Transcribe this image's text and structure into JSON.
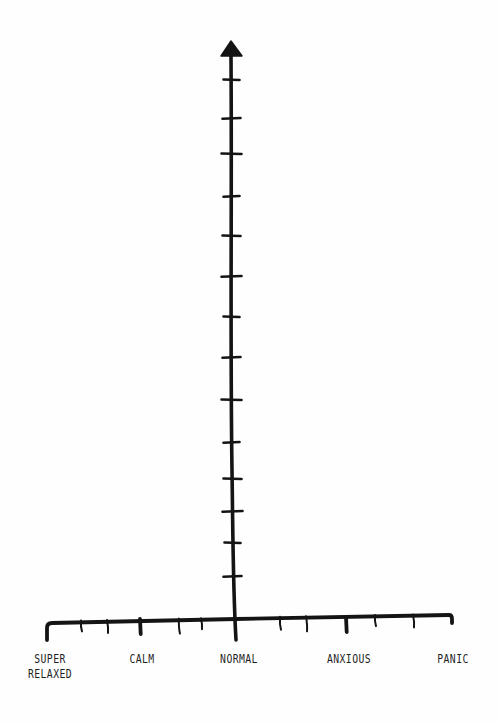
{
  "chart_data": {
    "type": "line",
    "title": "",
    "xlabel": "",
    "ylabel": "",
    "style": "hand-drawn blank axes worksheet",
    "grid": false,
    "legend": null,
    "x_axis": {
      "categories": [
        "SUPER\nRELAXED",
        "CALM",
        "NORMAL",
        "ANXIOUS",
        "PANIC"
      ],
      "category_positions_px": [
        47,
        140,
        236,
        346,
        452
      ],
      "minor_tick_positions_px": [
        81,
        107,
        179,
        201,
        280,
        306,
        375,
        413
      ],
      "baseline_y_px": 622
    },
    "y_axis": {
      "tick_labels": [],
      "tick_count": 14,
      "tick_positions_px": [
        80,
        118,
        154,
        196,
        236,
        276,
        317,
        357,
        400,
        442,
        479,
        511,
        543,
        576
      ],
      "has_arrow": true,
      "x_px": 232
    },
    "series": []
  },
  "colors": {
    "ink": "#141414",
    "label": "#1e1e1e",
    "paper": "#fefefe"
  },
  "labels": {
    "super_relaxed": "SUPER\nRELAXED",
    "calm": "CALM",
    "normal": "NORMAL",
    "anxious": "ANXIOUS",
    "panic": "PANIC"
  }
}
